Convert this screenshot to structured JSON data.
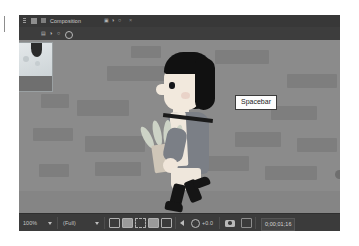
{
  "app": {
    "panel_title": "Composition",
    "panel_title_suffix": "미리보기",
    "tab_glyphs": [
      "▣",
      "◑",
      "○"
    ],
    "close_label": "×"
  },
  "subbar": {
    "items": [
      "▤",
      "◑",
      "○"
    ]
  },
  "viewer": {
    "tooltip_label": "Spacebar",
    "background_color": "#8b8b8b",
    "brick_color": "#7e7e7e",
    "ground_color": "#858585"
  },
  "figure": {
    "hair_color": "#111111",
    "skin_color": "#f2e9dd",
    "coat_color": "#7b7f86",
    "leaf_color": "#cdd3c6",
    "boot_color": "#151515"
  },
  "toolbar": {
    "zoom_value": "100%",
    "resolution_value": "(Full)",
    "magnification_label": "+0.0",
    "timecode": "0;00;01;16",
    "icons": [
      "region-of-interest-icon",
      "transparency-grid-icon",
      "mask-path-icon",
      "title-action-safe-icon",
      "channel-preview-icon",
      "reset-exposure-icon",
      "exposure-gear-icon",
      "snapshot-camera-icon",
      "show-snapshot-icon"
    ]
  }
}
